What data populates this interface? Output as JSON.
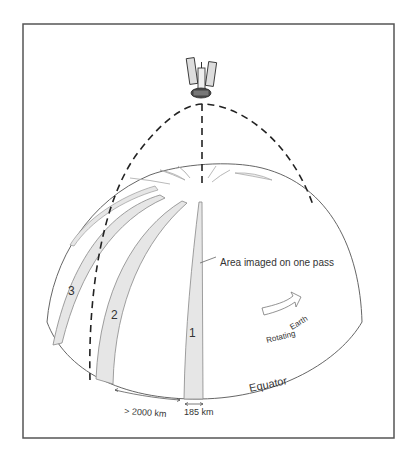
{
  "figure": {
    "labels": {
      "stripe_1": "1",
      "stripe_2": "2",
      "stripe_3": "3",
      "callout": "Area imaged on one pass",
      "rotation_line1": "Rotating",
      "rotation_line2": "Earth",
      "equator": "Equator",
      "distance_between_passes": "> 2000 km",
      "swath_width": "185 km"
    },
    "icons": {
      "satellite": "satellite-icon",
      "rotation_arrow": "curved-arrow-icon"
    },
    "colors": {
      "frame": "#555555",
      "outline": "#666666",
      "orbit": "#222222",
      "stripe_fill": "#e6e6e6",
      "background": "#ffffff"
    }
  }
}
